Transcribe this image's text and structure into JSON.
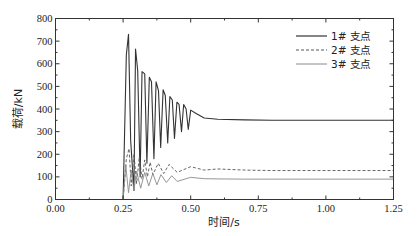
{
  "chart_data": {
    "type": "line",
    "title": "",
    "xlabel": "时间/s",
    "ylabel": "载荷/kN",
    "xlim": [
      0,
      1.25
    ],
    "ylim": [
      0,
      800
    ],
    "xticks": [
      "0.00",
      "0.25",
      "0.50",
      "0.75",
      "1.00",
      "1.25"
    ],
    "xtick_values": [
      0,
      0.25,
      0.5,
      0.75,
      1.0,
      1.25
    ],
    "yticks": [
      "0",
      "100",
      "200",
      "300",
      "400",
      "500",
      "600",
      "700",
      "800"
    ],
    "ytick_values": [
      0,
      100,
      200,
      300,
      400,
      500,
      600,
      700,
      800
    ],
    "grid": false,
    "legend_position": "upper right",
    "series": [
      {
        "name": "1# 支点",
        "style": "solid",
        "color": "#333333",
        "onset": 0.25,
        "peak": 730,
        "steady": 350,
        "oscillation_period": 0.034,
        "decay_time": 0.16,
        "x": [
          0.25,
          0.262,
          0.27,
          0.278,
          0.29,
          0.296,
          0.304,
          0.313,
          0.32,
          0.33,
          0.338,
          0.347,
          0.355,
          0.364,
          0.372,
          0.381,
          0.389,
          0.398,
          0.406,
          0.415,
          0.423,
          0.432,
          0.44,
          0.449,
          0.457,
          0.466,
          0.474,
          0.483,
          0.491,
          0.5,
          0.52,
          0.55,
          0.6,
          0.7,
          0.8,
          1.0,
          1.25
        ],
        "values": [
          0,
          640,
          730,
          260,
          40,
          665,
          570,
          100,
          565,
          555,
          160,
          540,
          520,
          180,
          520,
          480,
          230,
          485,
          460,
          250,
          455,
          440,
          270,
          430,
          420,
          300,
          420,
          400,
          310,
          395,
          380,
          360,
          355,
          352,
          350,
          350,
          350
        ]
      },
      {
        "name": "2# 支点",
        "style": "dashed",
        "color": "#555555",
        "onset": 0.25,
        "peak": 225,
        "steady": 128,
        "x": [
          0.25,
          0.262,
          0.272,
          0.28,
          0.29,
          0.3,
          0.31,
          0.32,
          0.33,
          0.34,
          0.35,
          0.36,
          0.38,
          0.4,
          0.42,
          0.45,
          0.5,
          0.55,
          0.6,
          0.7,
          0.8,
          1.0,
          1.25
        ],
        "values": [
          0,
          180,
          225,
          60,
          200,
          70,
          190,
          90,
          175,
          100,
          165,
          110,
          160,
          115,
          155,
          120,
          145,
          130,
          135,
          130,
          128,
          128,
          128
        ]
      },
      {
        "name": "3# 支点",
        "style": "solid-light",
        "color": "#8a8a8a",
        "onset": 0.25,
        "peak": 150,
        "steady": 90,
        "x": [
          0.25,
          0.26,
          0.27,
          0.28,
          0.29,
          0.3,
          0.315,
          0.33,
          0.345,
          0.36,
          0.375,
          0.39,
          0.41,
          0.43,
          0.45,
          0.5,
          0.55,
          0.6,
          0.7,
          0.8,
          1.0,
          1.25
        ],
        "values": [
          0,
          150,
          30,
          130,
          40,
          125,
          50,
          120,
          60,
          115,
          65,
          110,
          75,
          105,
          80,
          98,
          92,
          91,
          90,
          90,
          90,
          90
        ]
      }
    ]
  },
  "legend": {
    "items": [
      {
        "label": "1# 支点"
      },
      {
        "label": "2# 支点"
      },
      {
        "label": "3# 支点"
      }
    ]
  },
  "axes": {
    "xlabel": "时间/s",
    "ylabel": "载荷/kN"
  }
}
